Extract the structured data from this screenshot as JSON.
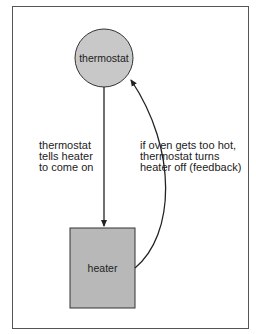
{
  "diagram": {
    "nodes": {
      "thermostat": {
        "label": "thermostat",
        "shape": "circle",
        "fill": "#c8c8c8"
      },
      "heater": {
        "label": "heater",
        "shape": "rectangle",
        "fill": "#b8b8b8"
      }
    },
    "edges": [
      {
        "from": "thermostat",
        "to": "heater",
        "label": "thermostat\ntells heater\nto come on"
      },
      {
        "from": "heater",
        "to": "thermostat",
        "label": "if oven gets too hot,\nthermostat turns\nheater off (feedback)"
      }
    ],
    "colors": {
      "stroke": "#333333",
      "frame": "#555555"
    }
  }
}
